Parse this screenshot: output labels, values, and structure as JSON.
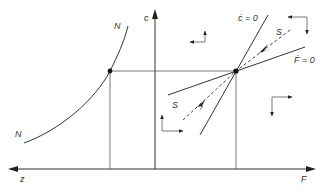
{
  "diagram": {
    "type": "phase diagram",
    "axes": {
      "vertical_label": "c",
      "horizontal_left_label": "z",
      "horizontal_right_label": "F"
    },
    "curves": {
      "N_top_label": "N",
      "N_bottom_label": "N",
      "c_dot_label": "ċ = 0",
      "F_dot_label": "Ḟ = 0",
      "S_upper_label": "S",
      "S_lower_label": "S"
    },
    "arrow_pairs": [
      {
        "position": "upper-left",
        "directions": [
          "up",
          "left"
        ]
      },
      {
        "position": "upper-right",
        "directions": [
          "left",
          "down"
        ]
      },
      {
        "position": "lower-right",
        "directions": [
          "right",
          "down"
        ]
      },
      {
        "position": "lower-left",
        "directions": [
          "up",
          "right"
        ]
      }
    ],
    "points": [
      {
        "name": "equilibrium",
        "description": "intersection of ċ=0 and Ḟ=0"
      },
      {
        "name": "N-curve point",
        "description": "on N curve at equilibrium c level"
      }
    ],
    "colors": {
      "ink": "#333333",
      "background": "#ffffff"
    }
  }
}
